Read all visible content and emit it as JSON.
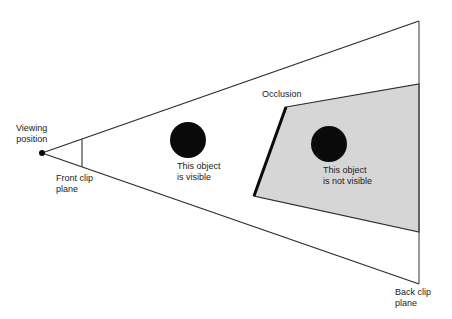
{
  "diagram": {
    "type": "view-frustum-culling",
    "colors": {
      "background": "#ffffff",
      "line": "#2a2a2a",
      "occluder_fill": "#d6d6d6",
      "object_fill": "#0a0a0a"
    },
    "labels": {
      "viewing_position": [
        "Viewing",
        "position"
      ],
      "front_clip_plane": [
        "Front clip",
        "plane"
      ],
      "back_clip_plane": [
        "Back clip",
        "plane"
      ],
      "occlusion": "Occlusion",
      "visible_object": [
        "This object",
        "is visible"
      ],
      "hidden_object": [
        "This object",
        "is not visible"
      ]
    }
  }
}
